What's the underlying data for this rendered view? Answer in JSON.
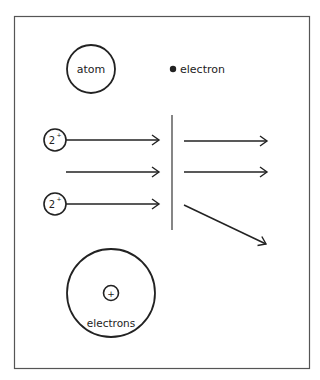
{
  "diagram": {
    "legend": {
      "atom_label": "atom",
      "electron_label": "electron"
    },
    "particles": [
      {
        "label": "2",
        "superscript": "+"
      },
      {
        "label": "2",
        "superscript": "+"
      }
    ],
    "nucleus": {
      "symbol": "+",
      "label": "electrons"
    },
    "colors": {
      "stroke": "#222222",
      "frame": "#555555",
      "background": "#ffffff"
    }
  }
}
